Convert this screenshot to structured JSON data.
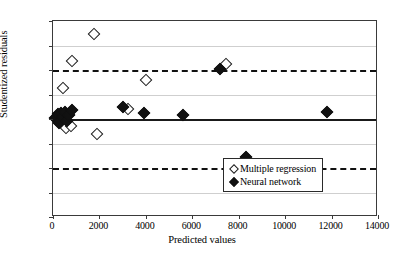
{
  "chart_data": {
    "type": "scatter",
    "title": "",
    "xlabel": "Predicted values",
    "ylabel": "Studentized residuals",
    "xlim": [
      0,
      14000
    ],
    "ylim": [
      -4,
      4
    ],
    "xticks": [
      0,
      2000,
      4000,
      6000,
      8000,
      10000,
      12000,
      14000
    ],
    "xtick_labels": [
      "0",
      "2000",
      "4000",
      "6000",
      "8000",
      "10000",
      "12000",
      "14000"
    ],
    "yticks": [
      -4,
      -3,
      -2,
      -1,
      0,
      1,
      2,
      3,
      4
    ],
    "ytick_labels": [
      "-4",
      "-3",
      "-2",
      "-1",
      "0",
      "1",
      "2",
      "3",
      "4"
    ],
    "grid": "horizontal",
    "legend_position": "lower right",
    "reference_lines": [
      {
        "name": "zero-line",
        "y": 0,
        "style": "solid",
        "color": "#1a1a1a"
      },
      {
        "name": "upper-limit",
        "y": 2,
        "style": "dashed",
        "color": "#111111"
      },
      {
        "name": "lower-limit",
        "y": -2,
        "style": "dashed",
        "color": "#111111"
      }
    ],
    "series": [
      {
        "name": "Multiple regression",
        "marker": "hollow-diamond",
        "color": "#ffffff",
        "edge_color": "#1a1a1a",
        "points": [
          {
            "x": 150,
            "y": 0.05
          },
          {
            "x": 330,
            "y": -0.1
          },
          {
            "x": 420,
            "y": 1.25
          },
          {
            "x": 560,
            "y": -0.35
          },
          {
            "x": 760,
            "y": -0.3
          },
          {
            "x": 800,
            "y": 2.35
          },
          {
            "x": 1750,
            "y": 3.45
          },
          {
            "x": 1900,
            "y": -0.6
          },
          {
            "x": 3250,
            "y": 0.4
          },
          {
            "x": 4000,
            "y": 1.6
          },
          {
            "x": 7450,
            "y": 2.25
          }
        ]
      },
      {
        "name": "Neural network",
        "marker": "filled-diamond",
        "color": "#111111",
        "edge_color": "#111111",
        "points": [
          {
            "x": 90,
            "y": 0.05
          },
          {
            "x": 200,
            "y": 0.2
          },
          {
            "x": 260,
            "y": -0.15
          },
          {
            "x": 350,
            "y": 0.25
          },
          {
            "x": 430,
            "y": 0.1
          },
          {
            "x": 520,
            "y": 0.3
          },
          {
            "x": 620,
            "y": -0.1
          },
          {
            "x": 700,
            "y": 0.15
          },
          {
            "x": 820,
            "y": 0.35
          },
          {
            "x": 3000,
            "y": 0.5
          },
          {
            "x": 3900,
            "y": 0.25
          },
          {
            "x": 5600,
            "y": 0.15
          },
          {
            "x": 7200,
            "y": 2.05
          },
          {
            "x": 8300,
            "y": -1.55
          },
          {
            "x": 11800,
            "y": 0.3
          }
        ]
      }
    ]
  },
  "legend": {
    "entries": [
      {
        "label": "Multiple regression",
        "marker": "hollow-diamond"
      },
      {
        "label": "Neural network",
        "marker": "filled-diamond"
      }
    ]
  }
}
